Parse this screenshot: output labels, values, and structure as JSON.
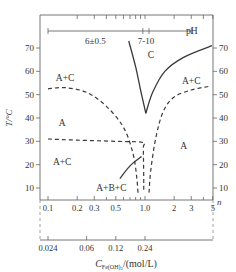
{
  "chart_data": {
    "type": "line",
    "title": "",
    "xlabel": "n",
    "ylabel": "T/°C",
    "x_scale": "log",
    "xlim": [
      0.09,
      5.6
    ],
    "ylim": [
      5,
      84
    ],
    "y_ticks": [
      10,
      20,
      30,
      40,
      50,
      60,
      70
    ],
    "y_tick_labels": [
      "10",
      "20",
      "30",
      "40",
      "50",
      "60",
      "70"
    ],
    "x_ticks": [
      0.1,
      0.2,
      0.3,
      0.5,
      1.0,
      2,
      3,
      5
    ],
    "x_tick_labels": [
      "0.1",
      "0.2",
      "0.3",
      "0.5",
      "1.0",
      "2",
      "3",
      "5"
    ],
    "x_minor_ticks": [
      0.4,
      0.6,
      0.7,
      0.8,
      0.9,
      4
    ],
    "secondary_x_axis": {
      "label_main": "C",
      "label_sub": "Fe(OH)",
      "label_sub2": "2",
      "label_unit": "/(mol/L)",
      "ticks": [
        0.1,
        0.25,
        0.5,
        1.0
      ],
      "tick_labels": [
        "0.024",
        "0.06",
        "0.12",
        "0.24"
      ]
    },
    "ph_scale": {
      "label": "pH",
      "segments": [
        {
          "label": "6±0.5",
          "from": 0.1,
          "to": 0.95
        },
        {
          "label": "7-10",
          "from": 0.95,
          "to": 1.1
        },
        {
          "label": "",
          "from": 1.1,
          "to": 3.0
        }
      ],
      "top_ticks": [
        0.2,
        0.3,
        0.4,
        0.5,
        0.6,
        0.7,
        0.8,
        0.9,
        1.0,
        2,
        3,
        4,
        5
      ]
    },
    "series": [
      {
        "name": "C boundary left",
        "style": "solid",
        "points": [
          [
            0.68,
            73
          ],
          [
            0.8,
            62
          ],
          [
            0.9,
            52
          ],
          [
            1.02,
            42
          ]
        ]
      },
      {
        "name": "C boundary right",
        "style": "solid",
        "points": [
          [
            1.02,
            42
          ],
          [
            1.2,
            51
          ],
          [
            1.6,
            60
          ],
          [
            2.5,
            66
          ],
          [
            4.9,
            71
          ]
        ]
      },
      {
        "name": "A+C/A boundary left",
        "style": "dashed",
        "points": [
          [
            0.1,
            52.5
          ],
          [
            0.15,
            53
          ],
          [
            0.25,
            51
          ],
          [
            0.4,
            45
          ],
          [
            0.6,
            36
          ],
          [
            0.75,
            25
          ],
          [
            0.82,
            15
          ],
          [
            0.85,
            7
          ]
        ]
      },
      {
        "name": "A+C/A boundary right",
        "style": "dashed",
        "points": [
          [
            1.1,
            8
          ],
          [
            1.15,
            18
          ],
          [
            1.3,
            32
          ],
          [
            1.55,
            43
          ],
          [
            2.0,
            49
          ],
          [
            3.0,
            52
          ],
          [
            4.5,
            53.5
          ]
        ]
      },
      {
        "name": "A/A+C horizontal",
        "style": "dashed",
        "points": [
          [
            0.1,
            31
          ],
          [
            0.2,
            30.5
          ],
          [
            0.5,
            30
          ],
          [
            0.95,
            29.5
          ],
          [
            0.96,
            27
          ],
          [
            0.97,
            15
          ],
          [
            0.97,
            9
          ]
        ]
      },
      {
        "name": "A+B+C boundary",
        "style": "solid",
        "points": [
          [
            0.55,
            14
          ],
          [
            0.7,
            19.5
          ],
          [
            0.92,
            23.5
          ]
        ]
      }
    ],
    "region_labels": [
      {
        "text": "C",
        "x": 1.15,
        "y": 67
      },
      {
        "text": "A+C",
        "x": 0.15,
        "y": 57
      },
      {
        "text": "A+C",
        "x": 3.0,
        "y": 56
      },
      {
        "text": "A",
        "x": 0.14,
        "y": 38
      },
      {
        "text": "A",
        "x": 2.5,
        "y": 28
      },
      {
        "text": "A+C",
        "x": 0.14,
        "y": 21
      },
      {
        "text": "A+B+C",
        "x": 0.45,
        "y": 10
      }
    ]
  }
}
